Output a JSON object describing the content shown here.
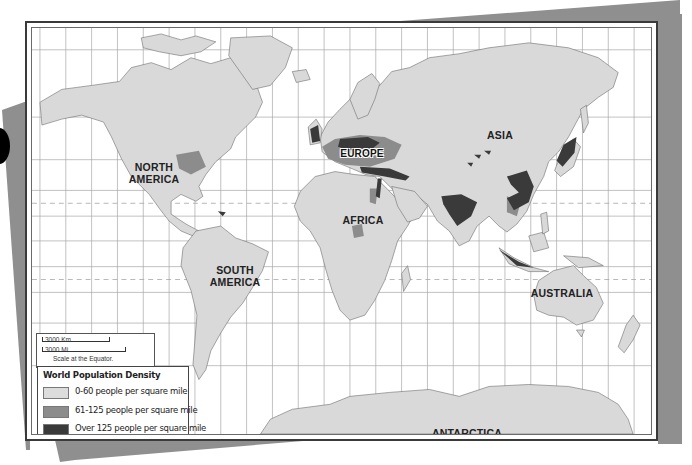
{
  "map": {
    "title": "World Population Density",
    "continent_labels": {
      "north_america": "NORTH\nAMERICA",
      "north_america_line1": "NORTH",
      "north_america_line2": "AMERICA",
      "south_america_line1": "SOUTH",
      "south_america_line2": "AMERICA",
      "europe": "EUROPE",
      "asia": "ASIA",
      "africa": "AFRICA",
      "australia": "AUSTRALIA",
      "antarctica": "ANTARCTICA"
    },
    "scale": {
      "km_label": "3000 Km",
      "mi_label": "3000 Mi.",
      "note": "Scale at the Equator."
    },
    "legend": {
      "title": "World Population Density",
      "items": [
        {
          "label": "0-60 people per square mile",
          "color": "#dcdcdc"
        },
        {
          "label": "61-125 people per square mile",
          "color": "#8c8c8c"
        },
        {
          "label": "Over 125 people per square mile",
          "color": "#3a3a3a"
        }
      ]
    },
    "colors": {
      "land": "#d9d9d9",
      "medium_density": "#8c8c8c",
      "high_density": "#3a3a3a",
      "water": "#ffffff",
      "grid": "#9a9a9a",
      "shadow": "#8f8f8f"
    }
  }
}
